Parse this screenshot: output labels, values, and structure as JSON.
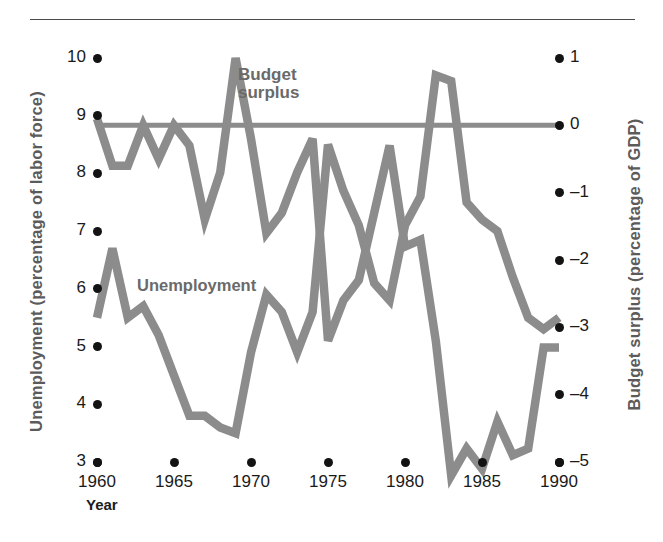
{
  "chart_data": {
    "type": "line",
    "title": "",
    "xlabel": "Year",
    "ylabel_left": "Unemployment (percentage of labor force)",
    "ylabel_right": "Budget surplus (percentage of GDP)",
    "xlim": [
      1960,
      1990
    ],
    "x_ticks": [
      "1960",
      "1965",
      "1970",
      "1975",
      "1980",
      "1985",
      "1990"
    ],
    "x_tick_values": [
      1960,
      1965,
      1970,
      1975,
      1980,
      1985,
      1990
    ],
    "ylim_left": [
      3,
      10
    ],
    "y_ticks_left": [
      "3",
      "4",
      "5",
      "6",
      "7",
      "8",
      "9",
      "10"
    ],
    "y_tick_values_left": [
      3,
      4,
      5,
      6,
      7,
      8,
      9,
      10
    ],
    "ylim_right": [
      -6,
      1
    ],
    "y_ticks_right": [
      "1",
      "0",
      "–1",
      "–2",
      "–3",
      "–4",
      "–5"
    ],
    "y_tick_values_right": [
      1,
      0,
      -1,
      -2,
      -3,
      -4,
      -5
    ],
    "grid": false,
    "legend_position": "inline-annotations",
    "zero_line_right_axis": 0,
    "x": [
      1960,
      1961,
      1962,
      1963,
      1964,
      1965,
      1966,
      1967,
      1968,
      1969,
      1970,
      1971,
      1972,
      1973,
      1974,
      1975,
      1976,
      1977,
      1978,
      1979,
      1980,
      1981,
      1982,
      1983,
      1984,
      1985,
      1986,
      1987,
      1988,
      1989,
      1990
    ],
    "series": [
      {
        "name": "Unemployment",
        "axis": "left",
        "units": "percentage of labor force",
        "color": "#8c8c8c",
        "values": [
          5.5,
          6.7,
          5.5,
          5.7,
          5.2,
          4.5,
          3.8,
          3.8,
          3.6,
          3.5,
          4.9,
          5.9,
          5.6,
          4.9,
          5.6,
          8.5,
          7.7,
          7.1,
          6.1,
          5.8,
          7.1,
          7.6,
          9.7,
          9.6,
          7.5,
          7.2,
          7.0,
          6.2,
          5.5,
          5.3,
          5.5
        ]
      },
      {
        "name": "Budget surplus",
        "axis": "right",
        "units": "percentage of GDP",
        "color": "#8c8c8c",
        "values": [
          0.1,
          -0.6,
          -0.6,
          0.0,
          -0.5,
          0.0,
          -0.3,
          -1.4,
          -0.7,
          1.0,
          -0.2,
          -1.6,
          -1.3,
          -0.7,
          -0.2,
          -3.2,
          -2.6,
          -2.3,
          -1.3,
          -0.3,
          -1.8,
          -1.7,
          -3.2,
          -5.2,
          -4.8,
          -5.1,
          -4.4,
          -4.9,
          -4.8,
          -3.3,
          -3.3
        ]
      }
    ],
    "annotations": [
      {
        "text": "Budget\nsurplus",
        "x": 1970.5,
        "y_right": 0.75
      },
      {
        "text": "Unemployment",
        "x": 1963.5,
        "y_left": 6.25
      }
    ]
  },
  "colors": {
    "line": "#8c8c8c",
    "label": "#6a6a6a",
    "tick_text": "#1a1a1a",
    "dot": "#131313",
    "rule": "#4a4a4a",
    "background": "#ffffff"
  }
}
